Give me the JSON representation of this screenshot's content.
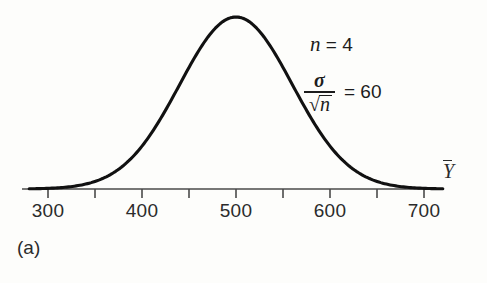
{
  "figure": {
    "caption": "(a)",
    "axis_variable_label": "Y",
    "annotations": {
      "sample_size_symbol": "n",
      "sample_size_text": " = 4",
      "sigma_symbol": "σ",
      "sqrt_symbol": "√",
      "sqrt_radicand": "n",
      "standard_error_text": "= 60"
    }
  },
  "chart_data": {
    "type": "line",
    "title": "",
    "subtitle": "",
    "xlabel": "Ȳ",
    "ylabel": "",
    "grid": false,
    "legend": null,
    "distribution": "normal",
    "mean": 500,
    "std_dev": 60,
    "sample_size": 4,
    "standard_error": 60,
    "xlim": [
      280,
      720
    ],
    "ylim": [
      0,
      1
    ],
    "axis_ticks_major": [
      300,
      400,
      500,
      600,
      700
    ],
    "axis_ticks_minor": [
      350,
      450,
      550,
      650
    ],
    "tick_labels": [
      "300",
      "400",
      "500",
      "600",
      "700"
    ],
    "peak_value_x": 500,
    "x": [
      300,
      320,
      340,
      360,
      380,
      400,
      420,
      440,
      460,
      480,
      500,
      520,
      540,
      560,
      580,
      600,
      620,
      640,
      660,
      680,
      700
    ],
    "y": [
      0.0008,
      0.0029,
      0.0091,
      0.0251,
      0.0608,
      0.1294,
      0.2494,
      0.4111,
      0.6412,
      0.8465,
      1.0,
      0.8465,
      0.6412,
      0.4111,
      0.2494,
      0.1294,
      0.0608,
      0.0251,
      0.0091,
      0.0029,
      0.0008
    ]
  }
}
